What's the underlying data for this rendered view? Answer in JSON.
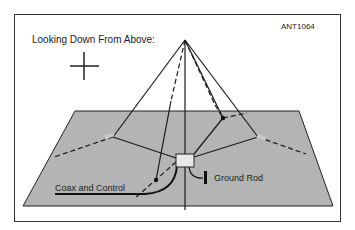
{
  "diagram": {
    "id_code": "ANT1064",
    "title": "Looking Down From Above:",
    "labels": {
      "coax": "Coax and Control",
      "ground": "Ground Rod"
    },
    "colors": {
      "ground_plane": "#b4b4b4",
      "line": "#1a1a1a",
      "box": "#e8e8e8",
      "frame": "#333333"
    }
  }
}
